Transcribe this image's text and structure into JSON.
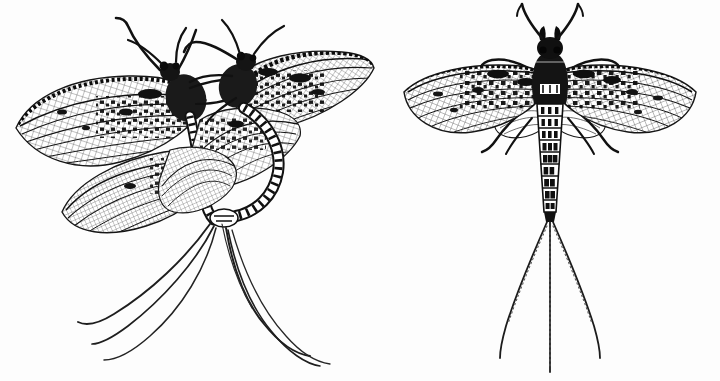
{
  "plate": {
    "title": "Mayflies (Ephemeroptera) engraving plate",
    "background_color": "#fdfdfd",
    "ink_color": "#111111",
    "width": 720,
    "height": 381,
    "style": "black-and-white line engraving / stipple illustration",
    "caption": "",
    "labels": []
  },
  "figures": [
    {
      "id": "mating-pair",
      "name": "Mayfly mating pair, wings spread",
      "position": "left",
      "subject_count": 2,
      "wing_pairs_visible": 4,
      "tails_visible": 5,
      "description": "Two adult mayflies joined in flight, forewings spread wide, long trailing cerci sweeping down and left",
      "bounds": {
        "x": 8,
        "y": 12,
        "width": 368,
        "height": 350
      }
    },
    {
      "id": "single-specimen",
      "name": "Mayfly adult, dorsal view, wings spread",
      "position": "right",
      "subject_count": 1,
      "wing_pairs_visible": 2,
      "tails_visible": 3,
      "abdomen_segments": 9,
      "legs_visible": 6,
      "description": "Single adult mayfly seen from above with symmetric spread forewings, banded abdomen and three long caudal filaments",
      "bounds": {
        "x": 400,
        "y": 10,
        "width": 300,
        "height": 360
      }
    }
  ],
  "ink": {
    "dark": "#111111",
    "mid": "#3a3a3a",
    "light": "#7b7b7b",
    "paper": "#fdfdfd"
  }
}
